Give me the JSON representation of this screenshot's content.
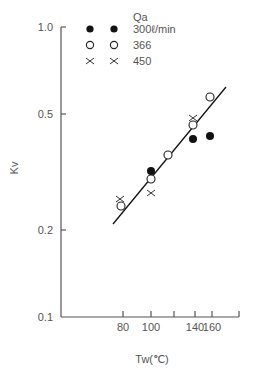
{
  "chart_data": {
    "type": "scatter",
    "title": "",
    "xlabel": "Tw(℃)",
    "ylabel": "Kv",
    "yscale": "log",
    "ylim": [
      0.1,
      1.0
    ],
    "y_ticks": [
      {
        "value": 0.1,
        "label": "0.1",
        "py": 317
      },
      {
        "value": 0.2,
        "label": "0.2",
        "py": 230
      },
      {
        "value": 0.5,
        "label": "0.5",
        "py": 114
      },
      {
        "value": 1.0,
        "label": "1.0",
        "py": 27
      }
    ],
    "x_ticks": [
      {
        "value": 80,
        "label": "80",
        "px": 123
      },
      {
        "value": 100,
        "label": "100",
        "px": 151
      },
      {
        "value": 120,
        "label": "",
        "px": 174
      },
      {
        "value": 140,
        "label": "140",
        "px": 195
      },
      {
        "value": 160,
        "label": "160",
        "px": 212
      },
      {
        "value": 180,
        "label": "",
        "px": 239
      }
    ],
    "grid": false,
    "legend": {
      "title": "Qa",
      "position": "top-left-inside",
      "entries": [
        {
          "label": "300ℓ/min",
          "marker": "filled-circle"
        },
        {
          "label": "366",
          "marker": "open-circle"
        },
        {
          "label": "450",
          "marker": "cross"
        }
      ]
    },
    "series": [
      {
        "name": "300ℓ/min",
        "marker": "filled-circle",
        "points": [
          {
            "x": 100,
            "y": 0.32,
            "px": 151,
            "py": 171
          },
          {
            "x": 140,
            "y": 0.41,
            "px": 193,
            "py": 139
          },
          {
            "x": 160,
            "y": 0.42,
            "px": 210,
            "py": 136
          }
        ]
      },
      {
        "name": "366",
        "marker": "open-circle",
        "points": [
          {
            "x": 80,
            "y": 0.24,
            "px": 121,
            "py": 206
          },
          {
            "x": 100,
            "y": 0.3,
            "px": 151,
            "py": 179
          },
          {
            "x": 115,
            "y": 0.36,
            "px": 168,
            "py": 155
          },
          {
            "x": 140,
            "y": 0.46,
            "px": 193,
            "py": 125
          },
          {
            "x": 160,
            "y": 0.57,
            "px": 210,
            "py": 97
          }
        ]
      },
      {
        "name": "450",
        "marker": "cross",
        "points": [
          {
            "x": 80,
            "y": 0.26,
            "px": 120,
            "py": 199
          },
          {
            "x": 100,
            "y": 0.27,
            "px": 151,
            "py": 193
          },
          {
            "x": 140,
            "y": 0.49,
            "px": 193,
            "py": 118
          }
        ]
      }
    ],
    "fit_line": {
      "x_start": 73,
      "y_start": 0.21,
      "px1": 113,
      "py1": 224,
      "x_end": 175,
      "y_end": 0.62,
      "px2": 226,
      "py2": 87
    }
  },
  "colors": {
    "axis": "#555555",
    "marker": "#111111",
    "text": "#555555"
  }
}
